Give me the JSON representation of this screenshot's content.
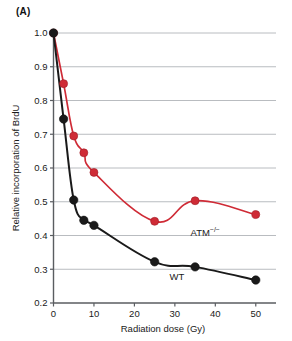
{
  "panel": {
    "label": "(A)"
  },
  "chart_data": {
    "type": "line",
    "title": "",
    "subtitle": "",
    "xlabel": "Radiation dose (Gy)",
    "ylabel": "Relative incorporation of BrdU",
    "xlim": [
      0,
      55
    ],
    "ylim": [
      0.2,
      1.0
    ],
    "xticks": [
      0,
      10,
      20,
      30,
      40,
      50
    ],
    "xtick_labels": [
      "0",
      "10",
      "20",
      "30",
      "40",
      "50"
    ],
    "yticks": [
      0.2,
      0.3,
      0.4,
      0.5,
      0.6,
      0.7,
      0.8,
      0.9,
      1.0
    ],
    "ytick_labels": [
      "0.2",
      "0.3",
      "0.4",
      "0.5",
      "0.6",
      "0.7",
      "0.8",
      "0.9",
      "1.0"
    ],
    "grid": "horizontal",
    "grid_color": "#b9bcc0",
    "legend": "inline-annotations",
    "markers": "filled-circle",
    "series": [
      {
        "name": "ATM−/−",
        "name_base": "ATM",
        "name_sup": "−/−",
        "color": "#cf2b36",
        "x": [
          0,
          2.5,
          5,
          7.5,
          10,
          25,
          35,
          50
        ],
        "values": [
          1.0,
          0.85,
          0.695,
          0.645,
          0.587,
          0.442,
          0.503,
          0.462
        ],
        "label_x": 37.5,
        "label_y": 0.4
      },
      {
        "name": "WT",
        "name_base": "WT",
        "name_sup": "",
        "color": "#1a1a1a",
        "x": [
          0,
          2.5,
          5,
          7.5,
          10,
          25,
          35,
          50
        ],
        "values": [
          1.0,
          0.745,
          0.505,
          0.445,
          0.43,
          0.322,
          0.307,
          0.268
        ],
        "label_x": 30.5,
        "label_y": 0.268
      }
    ]
  }
}
